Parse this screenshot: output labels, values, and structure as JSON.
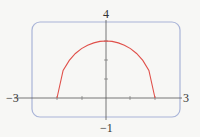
{
  "labels": {
    "ymax": "4",
    "ymin": "−1",
    "xmin": "−3",
    "xmax": "3"
  },
  "colors": {
    "background": "#f7f7f5",
    "frame": "#a9b4d8",
    "axes": "#555555",
    "curve": "#e0504a"
  },
  "chart_data": {
    "type": "line",
    "title": "",
    "xlabel": "",
    "ylabel": "",
    "xlim": [
      -3,
      3
    ],
    "ylim": [
      -1,
      4
    ],
    "x_ticks": [
      -2,
      -1,
      1,
      2
    ],
    "y_ticks": [
      1,
      2,
      3
    ],
    "grid": false,
    "series": [
      {
        "name": "upper half-ellipse y = 1.5·sqrt(4 − x²)",
        "x": [
          -2,
          -1.75,
          -1.5,
          -1.25,
          -1,
          -0.75,
          -0.5,
          -0.25,
          0,
          0.25,
          0.5,
          0.75,
          1,
          1.25,
          1.5,
          1.75,
          2
        ],
        "y": [
          0,
          1.45,
          1.98,
          2.34,
          2.6,
          2.78,
          2.9,
          2.98,
          3.0,
          2.98,
          2.9,
          2.78,
          2.6,
          2.34,
          1.98,
          1.45,
          0
        ]
      }
    ]
  }
}
